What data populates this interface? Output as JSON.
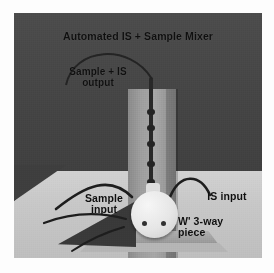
{
  "figure": {
    "kind": "annotated-laboratory-photograph",
    "title": "Automated IS + Sample Mixer",
    "annotations": [
      {
        "id": "title",
        "text": "Automated IS + Sample Mixer",
        "lines": [
          "Automated IS + Sample Mixer"
        ]
      },
      {
        "id": "output",
        "text": "Sample + IS output",
        "lines": [
          "Sample + IS",
          "output"
        ]
      },
      {
        "id": "sample-input",
        "text": "Sample input",
        "lines": [
          "Sample",
          "input"
        ]
      },
      {
        "id": "is-input",
        "text": "IS input",
        "lines": [
          "IS input"
        ]
      },
      {
        "id": "valve",
        "text": "W' 3-way piece",
        "lines": [
          "W' 3-way",
          "piece"
        ]
      }
    ],
    "colors": {
      "page_background": "#ffffff",
      "photo_background_wall": "#474747",
      "bench_surface": "#c6c6c6",
      "column_gray": "#9c9c9c",
      "valve_white": "#e9e9e9",
      "tubing_dark": "#2a2a2a",
      "label_text": "#111111"
    },
    "parts": {
      "column_label": "vertical mixing column",
      "valve_label": "white circular 3-way valve piece",
      "base_label": "metal stand base plate",
      "tube_output_label": "curved sample + IS output tubing",
      "tube_sample_label": "sample input tubing",
      "tube_is_label": "IS input tubing"
    }
  }
}
